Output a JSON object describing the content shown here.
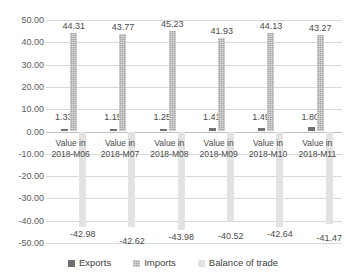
{
  "chart_data": {
    "type": "bar",
    "title": "",
    "xlabel": "",
    "ylabel": "",
    "ylim": [
      -50,
      50
    ],
    "ytick_step": 10,
    "ytick_labels": [
      "50.00",
      "40.00",
      "30.00",
      "20.00",
      "10.00",
      "0.00",
      "-10.00",
      "-20.00",
      "-30.00",
      "-40.00",
      "-50.00"
    ],
    "ytick_values": [
      50,
      40,
      30,
      20,
      10,
      0,
      -10,
      -20,
      -30,
      -40,
      -50
    ],
    "grid": true,
    "legend_position": "bottom",
    "categories": [
      "Value in 2018-M06",
      "Value in 2018-M07",
      "Value in 2018-M08",
      "Value in 2018-M09",
      "Value in 2018-M10",
      "Value in 2018-M11"
    ],
    "category_lines": [
      [
        "Value in",
        "2018-M06"
      ],
      [
        "Value in",
        "2018-M07"
      ],
      [
        "Value in",
        "2018-M08"
      ],
      [
        "Value in",
        "2018-M09"
      ],
      [
        "Value in",
        "2018-M10"
      ],
      [
        "Value in",
        "2018-M11"
      ]
    ],
    "series": [
      {
        "name": "Exports",
        "color": "#707070",
        "values": [
          1.33,
          1.15,
          1.25,
          1.41,
          1.49,
          1.8
        ],
        "labels": [
          "1.33",
          "1.15",
          "1.25",
          "1.41",
          "1.49",
          "1.80"
        ]
      },
      {
        "name": "Imports",
        "color": "#a6a6a6",
        "values": [
          44.31,
          43.77,
          45.23,
          41.93,
          44.13,
          43.27
        ],
        "labels": [
          "44.31",
          "43.77",
          "45.23",
          "41.93",
          "44.13",
          "43.27"
        ]
      },
      {
        "name": "Balance of trade",
        "color": "#e3e3e3",
        "values": [
          -42.98,
          -42.62,
          -43.98,
          -40.52,
          -42.64,
          -41.47
        ],
        "labels": [
          "-42.98",
          "-42.62",
          "-43.98",
          "-40.52",
          "-42.64",
          "-41.47"
        ]
      }
    ]
  },
  "legend": {
    "items": [
      {
        "label": "Exports"
      },
      {
        "label": "Imports"
      },
      {
        "label": "Balance of trade"
      }
    ]
  }
}
